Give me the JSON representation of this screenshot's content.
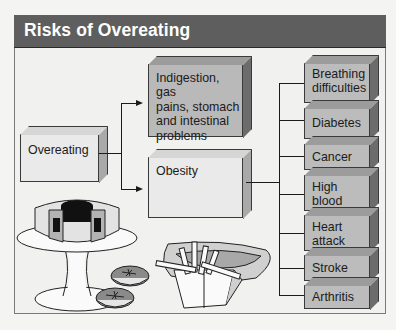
{
  "title": "Risks of Overeating",
  "diagram": {
    "source_node": {
      "label": "Overeating"
    },
    "middle_nodes": [
      {
        "label_lines": [
          "Indigestion, gas",
          "pains, stomach",
          "and intestinal",
          "problems"
        ]
      },
      {
        "label_lines": [
          "Obesity"
        ]
      }
    ],
    "obesity_risks": [
      {
        "label_lines": [
          "Breathing",
          "difficulties"
        ]
      },
      {
        "label_lines": [
          "Diabetes"
        ]
      },
      {
        "label_lines": [
          "Cancer"
        ]
      },
      {
        "label_lines": [
          "High blood",
          "pressure"
        ]
      },
      {
        "label_lines": [
          "Heart",
          "attack"
        ]
      },
      {
        "label_lines": [
          "Stroke"
        ]
      },
      {
        "label_lines": [
          "Arthritis"
        ]
      }
    ],
    "edges": [
      {
        "from": "Overeating",
        "to": "Indigestion, gas pains, stomach and intestinal problems"
      },
      {
        "from": "Overeating",
        "to": "Obesity"
      },
      {
        "from": "Obesity",
        "to": "Breathing difficulties"
      },
      {
        "from": "Obesity",
        "to": "Diabetes"
      },
      {
        "from": "Obesity",
        "to": "Cancer"
      },
      {
        "from": "Obesity",
        "to": "High blood pressure"
      },
      {
        "from": "Obesity",
        "to": "Heart attack"
      },
      {
        "from": "Obesity",
        "to": "Stroke"
      },
      {
        "from": "Obesity",
        "to": "Arthritis"
      }
    ]
  },
  "illustrations": [
    "bundt-cake-on-stand",
    "cookies",
    "french-fries",
    "hot-dog"
  ],
  "colors": {
    "title_bar": "#5e5e5e",
    "title_text": "#ffffff",
    "panel_bg": "#f1f1ef",
    "light_box": "#eaeaea",
    "mid_box": "#b9b9b9"
  }
}
